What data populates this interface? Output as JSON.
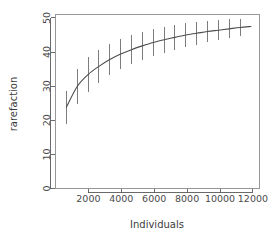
{
  "chart_data": {
    "type": "line",
    "title": "",
    "subtitle": "",
    "xlabel": "Individuals",
    "ylabel": "rarefaction",
    "grid": false,
    "legend": null,
    "xlim": [
      0,
      12400
    ],
    "ylim": [
      0,
      51
    ],
    "xticks": [
      2000,
      4000,
      6000,
      8000,
      10000,
      12000
    ],
    "xtick_labels": [
      "2000",
      "4000",
      "6000",
      "8000",
      "10000",
      "12000"
    ],
    "yticks": [
      0,
      10,
      20,
      30,
      40,
      50
    ],
    "ytick_labels": [
      "0",
      "10",
      "20",
      "30",
      "40",
      "50"
    ],
    "series": [
      {
        "name": "rarefaction",
        "style": "line-with-errorbars",
        "color": "#4d4d4d",
        "errorbar_color": "#6e6e6e",
        "x": [
          660,
          1320,
          1980,
          2640,
          3300,
          3960,
          4620,
          5280,
          5940,
          6600,
          7260,
          7920,
          8580,
          9240,
          9900,
          10560,
          11220,
          11880
        ],
        "y": [
          23.8,
          29.9,
          33.4,
          35.8,
          37.8,
          39.4,
          40.7,
          41.8,
          42.8,
          43.6,
          44.3,
          45.0,
          45.5,
          46.0,
          46.4,
          46.8,
          47.2,
          47.5
        ],
        "yerr_low": [
          19.0,
          24.8,
          28.4,
          31.0,
          33.2,
          35.0,
          36.4,
          37.7,
          38.8,
          39.8,
          40.7,
          41.5,
          42.2,
          42.8,
          43.4,
          44.0,
          44.6,
          47.5
        ],
        "yerr_high": [
          28.6,
          35.0,
          38.4,
          40.6,
          42.4,
          43.8,
          45.0,
          45.9,
          46.8,
          47.4,
          47.9,
          48.5,
          48.8,
          49.2,
          49.4,
          49.6,
          49.8,
          47.5
        ]
      }
    ]
  },
  "figure": {
    "background_color": "#ffffff",
    "axis_color": "#5a5a5a",
    "box_color": "#8c8c8c",
    "tick_text_color": "#4a4a4a"
  }
}
